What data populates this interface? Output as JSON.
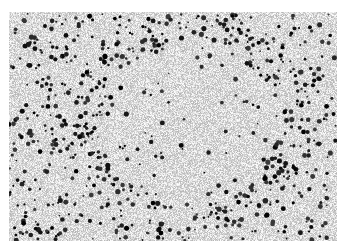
{
  "image": {
    "kind": "grayscale histology micrograph",
    "description": "Dense field of dark-stained nuclei scattered over a light speckled background, with a roughly circular follicle-like ring of denser dark cells around a paler center",
    "frame": {
      "x": 9,
      "y": 12,
      "width": 328,
      "height": 229
    },
    "background_color": "#ffffff",
    "tissue_base_color": "#e2e2e2",
    "nucleus_color": "#111111",
    "ring": {
      "cx": 190,
      "cy": 125,
      "rx": 110,
      "ry": 100
    }
  }
}
